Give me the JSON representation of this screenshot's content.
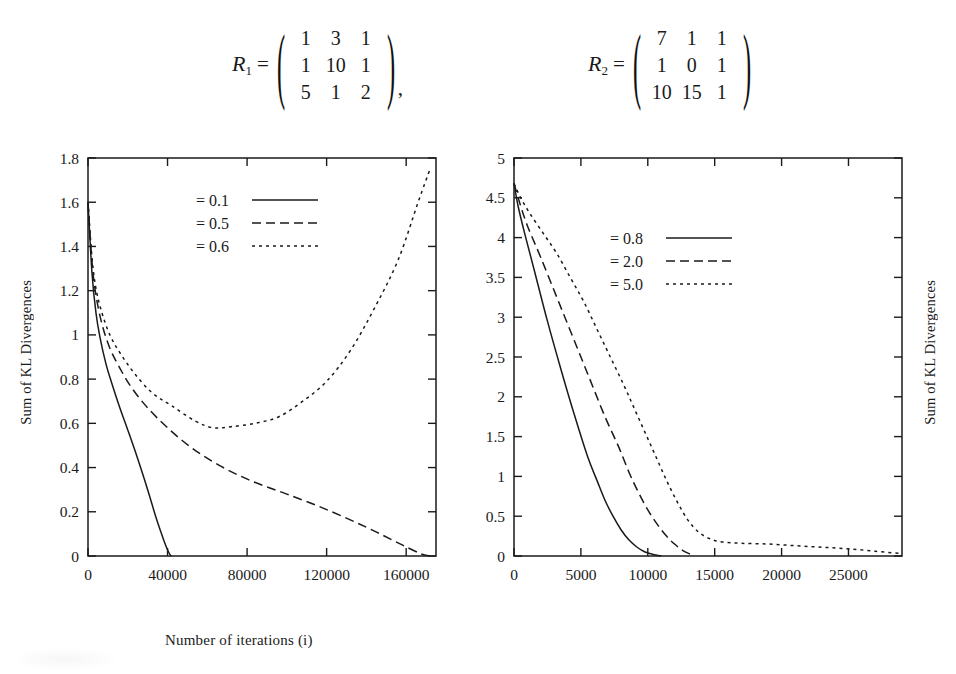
{
  "equation": {
    "matrices": [
      {
        "name": "R",
        "subscript": "1",
        "equals": "=",
        "rows": [
          [
            "1",
            "3",
            "1"
          ],
          [
            "1",
            "10",
            "1"
          ],
          [
            "5",
            "1",
            "2"
          ]
        ],
        "trailing": ","
      },
      {
        "name": "R",
        "subscript": "2",
        "equals": "=",
        "rows": [
          [
            "7",
            "1",
            "1"
          ],
          [
            "1",
            "0",
            "1"
          ],
          [
            "10",
            "15",
            "1"
          ]
        ],
        "trailing": ""
      }
    ]
  },
  "chart_data": [
    {
      "type": "line",
      "id": "left",
      "title": "",
      "xlabel": "Number of iterations (i)",
      "ylabel": "Sum of KL Divergences",
      "xlim": [
        0,
        175000
      ],
      "ylim": [
        0,
        1.8
      ],
      "xticks": [
        0,
        40000,
        80000,
        120000,
        160000
      ],
      "xticklabels": [
        "0",
        "40000",
        "80000",
        "120000",
        "160000"
      ],
      "yticks": [
        0,
        0.2,
        0.4,
        0.6,
        0.8,
        1,
        1.2,
        1.4,
        1.6,
        1.8
      ],
      "yticklabels": [
        "0",
        "0.2",
        "0.4",
        "0.6",
        "0.8",
        "1",
        "1.2",
        "1.4",
        "1.6",
        "1.8"
      ],
      "grid": false,
      "legend_position": "upper-center",
      "series": [
        {
          "name": "= 0.1",
          "style": "solid",
          "x": [
            0,
            2000,
            4000,
            6000,
            9000,
            12000,
            16000,
            20000,
            25000,
            30000,
            34000,
            37000,
            39000,
            40500,
            41500,
            42000
          ],
          "y": [
            1.6,
            1.28,
            1.1,
            0.99,
            0.87,
            0.78,
            0.67,
            0.57,
            0.44,
            0.3,
            0.18,
            0.1,
            0.05,
            0.018,
            0.003,
            0.0
          ]
        },
        {
          "name": "= 0.5",
          "style": "dashed",
          "x": [
            0,
            2000,
            4000,
            7000,
            11000,
            16000,
            22000,
            30000,
            40000,
            52000,
            66000,
            82000,
            100000,
            120000,
            140000,
            158000,
            168000,
            172000
          ],
          "y": [
            1.6,
            1.33,
            1.18,
            1.05,
            0.94,
            0.85,
            0.76,
            0.67,
            0.58,
            0.49,
            0.41,
            0.34,
            0.28,
            0.21,
            0.13,
            0.05,
            0.008,
            0.0
          ]
        },
        {
          "name": "= 0.6",
          "style": "dotted",
          "x": [
            0,
            2000,
            4000,
            7000,
            11000,
            16000,
            23000,
            32000,
            42000,
            54000,
            63000,
            72000,
            84000,
            96000,
            108000,
            120000,
            132000,
            144000,
            156000,
            166000,
            172000
          ],
          "y": [
            1.6,
            1.35,
            1.21,
            1.1,
            1.0,
            0.92,
            0.83,
            0.74,
            0.68,
            0.61,
            0.58,
            0.585,
            0.6,
            0.63,
            0.7,
            0.79,
            0.93,
            1.12,
            1.34,
            1.6,
            1.75
          ]
        }
      ]
    },
    {
      "type": "line",
      "id": "right",
      "title": "",
      "xlabel": "Number of iterations (i)",
      "ylabel": "Sum of KL Divergences",
      "xlim": [
        0,
        29000
      ],
      "ylim": [
        0,
        5
      ],
      "xticks": [
        0,
        5000,
        10000,
        15000,
        20000,
        25000
      ],
      "xticklabels": [
        "0",
        "5000",
        "10000",
        "15000",
        "20000",
        "25000"
      ],
      "yticks": [
        0,
        0.5,
        1,
        1.5,
        2,
        2.5,
        3,
        3.5,
        4,
        4.5,
        5
      ],
      "yticklabels": [
        "0",
        "0.5",
        "1",
        "1.5",
        "2",
        "2.5",
        "3",
        "3.5",
        "4",
        "4.5",
        "5"
      ],
      "grid": false,
      "legend_position": "upper-center",
      "series": [
        {
          "name": "= 0.8",
          "style": "solid",
          "x": [
            0,
            300,
            800,
            1500,
            2500,
            3500,
            4500,
            5500,
            6200,
            6800,
            7400,
            8000,
            8600,
            9200,
            9800,
            10400,
            11000
          ],
          "y": [
            4.68,
            4.4,
            4.05,
            3.6,
            2.95,
            2.35,
            1.78,
            1.25,
            0.95,
            0.7,
            0.5,
            0.33,
            0.2,
            0.11,
            0.05,
            0.02,
            0.0
          ]
        },
        {
          "name": "= 2.0",
          "style": "dashed",
          "x": [
            0,
            400,
            1000,
            2000,
            3200,
            4400,
            5600,
            6800,
            7800,
            8600,
            9300,
            10000,
            10700,
            11400,
            12000,
            12600,
            13200
          ],
          "y": [
            4.68,
            4.45,
            4.15,
            3.75,
            3.25,
            2.75,
            2.25,
            1.75,
            1.38,
            1.05,
            0.8,
            0.58,
            0.4,
            0.25,
            0.15,
            0.07,
            0.02
          ]
        },
        {
          "name": "= 5.0",
          "style": "dotted",
          "x": [
            0,
            500,
            1200,
            2200,
            3200,
            4200,
            5200,
            6200,
            7200,
            8200,
            9000,
            9800,
            10600,
            11400,
            12200,
            13000,
            13800,
            14600,
            15400,
            17000,
            19000,
            21000,
            23000,
            25000,
            27000,
            29000
          ],
          "y": [
            4.68,
            4.5,
            4.3,
            4.05,
            3.8,
            3.5,
            3.2,
            2.85,
            2.5,
            2.15,
            1.85,
            1.55,
            1.25,
            0.95,
            0.68,
            0.45,
            0.3,
            0.22,
            0.18,
            0.16,
            0.15,
            0.13,
            0.11,
            0.09,
            0.06,
            0.03
          ]
        }
      ]
    }
  ]
}
